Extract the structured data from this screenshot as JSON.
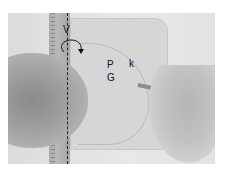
{
  "image": {
    "description": "Grayscale photo: hands holding a ruler and cutting along a curved line on a board, with annotation labels",
    "labels": {
      "v": "V",
      "p": "P",
      "g": "G",
      "k": "k"
    },
    "annotations": {
      "dashed_line": "vertical dashed line along ruler",
      "rotation_arrow": "curved arrow indicating rotation around vertical axis"
    }
  }
}
